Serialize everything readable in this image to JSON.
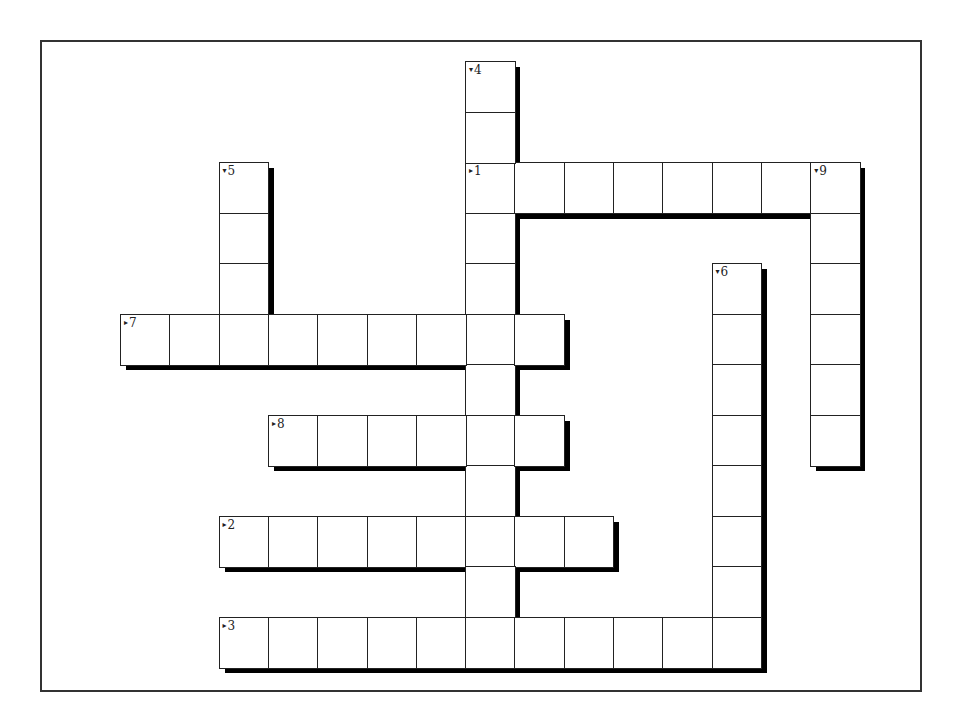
{
  "puzzle": {
    "type": "crossword",
    "cell_size": {
      "w": 49.3,
      "h": 50.5
    },
    "origin": {
      "x": 120,
      "y": 61
    },
    "entries": [
      {
        "number": "1",
        "direction": "across",
        "row": 2,
        "col": 7,
        "length": 8
      },
      {
        "number": "2",
        "direction": "across",
        "row": 9,
        "col": 2,
        "length": 8
      },
      {
        "number": "3",
        "direction": "across",
        "row": 11,
        "col": 2,
        "length": 11
      },
      {
        "number": "4",
        "direction": "down",
        "row": 0,
        "col": 7,
        "length": 12
      },
      {
        "number": "5",
        "direction": "down",
        "row": 2,
        "col": 2,
        "length": 4
      },
      {
        "number": "6",
        "direction": "down",
        "row": 4,
        "col": 12,
        "length": 8
      },
      {
        "number": "7",
        "direction": "across",
        "row": 5,
        "col": 0,
        "length": 9
      },
      {
        "number": "8",
        "direction": "across",
        "row": 7,
        "col": 3,
        "length": 6
      },
      {
        "number": "9",
        "direction": "down",
        "row": 2,
        "col": 14,
        "length": 6
      }
    ],
    "arrows": {
      "across": "▸",
      "down": "▾"
    }
  }
}
